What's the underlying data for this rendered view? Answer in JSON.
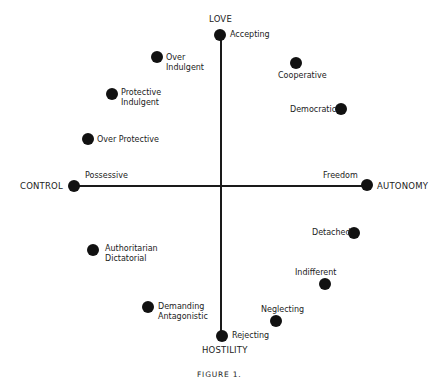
{
  "figure": {
    "caption": "FIGURE 1.",
    "poles": {
      "top": "LOVE",
      "bottom": "HOSTILITY",
      "left": "CONTROL",
      "right": "AUTONOMY"
    },
    "points": [
      {
        "id": "accepting",
        "line1": "Accepting",
        "line2": ""
      },
      {
        "id": "over-indulgent",
        "line1": "Over",
        "line2": "Indulgent"
      },
      {
        "id": "protective-indulgent",
        "line1": "Protective",
        "line2": "Indulgent"
      },
      {
        "id": "over-protective",
        "line1": "Over Protective",
        "line2": ""
      },
      {
        "id": "cooperative",
        "line1": "Cooperative",
        "line2": ""
      },
      {
        "id": "democratic",
        "line1": "Democratic",
        "line2": ""
      },
      {
        "id": "possessive",
        "line1": "Possessive",
        "line2": ""
      },
      {
        "id": "freedom",
        "line1": "Freedom",
        "line2": ""
      },
      {
        "id": "authoritarian-dictatorial",
        "line1": "Authoritarian",
        "line2": "Dictatorial"
      },
      {
        "id": "demanding-antagonistic",
        "line1": "Demanding",
        "line2": "Antagonistic"
      },
      {
        "id": "detached",
        "line1": "Detached",
        "line2": ""
      },
      {
        "id": "indifferent",
        "line1": "Indifferent",
        "line2": ""
      },
      {
        "id": "neglecting",
        "line1": "Neglecting",
        "line2": ""
      },
      {
        "id": "rejecting",
        "line1": "Rejecting",
        "line2": ""
      }
    ]
  }
}
